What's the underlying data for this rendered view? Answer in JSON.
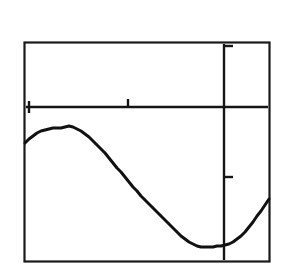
{
  "caption": {
    "text": "[–2, 0.5] by [–2.2, 1]",
    "x_window_label": "[–2, 0.5]",
    "connector": "by",
    "y_window_label": "[–2.2, 1]"
  },
  "colors": {
    "ink": "#111111",
    "background": "#ffffff",
    "frame": "#1a1a1a",
    "axis": "#151515",
    "curve": "#111111"
  },
  "chart_data": {
    "type": "line",
    "title": "[–2, 0.5] by [–2.2, 1]",
    "xlabel": "",
    "ylabel": "",
    "xlim": [
      -2,
      0.5
    ],
    "ylim": [
      -2.2,
      1
    ],
    "grid": false,
    "legend": null,
    "axes": {
      "x_axis_y_value": 0,
      "y_axis_x_value": 0,
      "x_axis_pixel_y": 107,
      "y_axis_pixel_x": 224,
      "frame_pixels": {
        "left": 24,
        "top": 42,
        "right": 270,
        "bottom": 262
      }
    },
    "ticks": {
      "x_tick_values": [
        -2,
        -1
      ],
      "x_tick_pixels": [
        28,
        128
      ],
      "y_tick_values": [
        1,
        -1
      ],
      "y_tick_pixels": [
        46,
        177
      ]
    },
    "series": [
      {
        "name": "curve",
        "x": [
          -2.0,
          -1.95,
          -1.9,
          -1.85,
          -1.8,
          -1.75,
          -1.7,
          -1.65,
          -1.6,
          -1.55,
          -1.5,
          -1.45,
          -1.4,
          -1.35,
          -1.3,
          -1.25,
          -1.2,
          -1.15,
          -1.1,
          -1.05,
          -1.0,
          -0.95,
          -0.9,
          -0.85,
          -0.8,
          -0.75,
          -0.7,
          -0.65,
          -0.6,
          -0.55,
          -0.5,
          -0.45,
          -0.4,
          -0.35,
          -0.3,
          -0.25,
          -0.2,
          -0.15,
          -0.1,
          -0.05,
          0.0,
          0.05,
          0.1,
          0.15,
          0.2,
          0.25,
          0.3,
          0.35,
          0.4,
          0.45,
          0.5
        ],
        "y": [
          -0.53,
          -0.46,
          -0.4,
          -0.35,
          -0.31,
          -0.29,
          -0.27,
          -0.26,
          -0.26,
          -0.27,
          -0.29,
          -0.32,
          -0.36,
          -0.41,
          -0.46,
          -0.52,
          -0.59,
          -0.66,
          -0.74,
          -0.82,
          -0.91,
          -1.0,
          -1.09,
          -1.18,
          -1.27,
          -1.36,
          -1.45,
          -1.54,
          -1.62,
          -1.7,
          -1.78,
          -1.85,
          -1.91,
          -1.97,
          -2.02,
          -2.06,
          -2.09,
          -2.11,
          -2.12,
          -2.12,
          -2.11,
          -2.09,
          -2.05,
          -2.0,
          -1.93,
          -1.85,
          -1.75,
          -1.63,
          -1.49,
          -1.33,
          -1.15
        ],
        "pixel_points": [
          [
            25,
            143
          ],
          [
            29,
            139
          ],
          [
            33,
            136
          ],
          [
            37,
            133
          ],
          [
            41,
            131
          ],
          [
            45,
            130
          ],
          [
            49,
            129
          ],
          [
            53,
            128
          ],
          [
            57,
            128
          ],
          [
            61,
            128
          ],
          [
            65,
            127
          ],
          [
            69,
            126
          ],
          [
            73,
            127
          ],
          [
            77,
            129
          ],
          [
            81,
            131
          ],
          [
            85,
            134
          ],
          [
            89,
            137
          ],
          [
            93,
            141
          ],
          [
            97,
            145
          ],
          [
            101,
            149
          ],
          [
            105,
            153
          ],
          [
            109,
            158
          ],
          [
            113,
            163
          ],
          [
            117,
            168
          ],
          [
            121,
            172
          ],
          [
            125,
            177
          ],
          [
            129,
            182
          ],
          [
            133,
            187
          ],
          [
            137,
            191
          ],
          [
            141,
            196
          ],
          [
            145,
            200
          ],
          [
            149,
            204
          ],
          [
            153,
            208
          ],
          [
            157,
            212
          ],
          [
            161,
            216
          ],
          [
            165,
            220
          ],
          [
            169,
            224
          ],
          [
            173,
            228
          ],
          [
            177,
            232
          ],
          [
            181,
            236
          ],
          [
            185,
            239
          ],
          [
            189,
            242
          ],
          [
            193,
            244
          ],
          [
            197,
            246
          ],
          [
            201,
            247
          ],
          [
            205,
            247
          ],
          [
            209,
            247
          ],
          [
            213,
            247
          ],
          [
            217,
            246
          ],
          [
            221,
            246
          ],
          [
            225,
            245
          ],
          [
            229,
            244
          ],
          [
            233,
            242
          ],
          [
            237,
            239
          ],
          [
            241,
            236
          ],
          [
            245,
            232
          ],
          [
            249,
            227
          ],
          [
            253,
            222
          ],
          [
            257,
            216
          ],
          [
            261,
            211
          ],
          [
            265,
            205
          ],
          [
            269,
            199
          ]
        ],
        "markers": "none",
        "linewidth": 3
      }
    ],
    "features": {
      "local_max_pixel": [
        69,
        126
      ],
      "local_min_pixel": [
        207,
        247
      ],
      "left_edge_pixel": [
        25,
        143
      ],
      "right_edge_pixel": [
        269,
        199
      ]
    }
  }
}
